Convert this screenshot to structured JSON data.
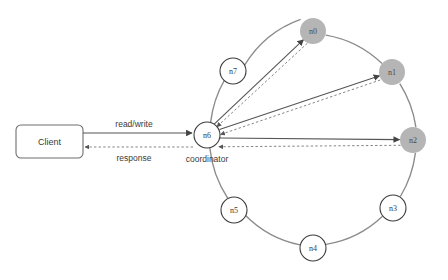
{
  "diagram": {
    "colors": {
      "ring_stroke": "#8c8c8c",
      "node_fill_plain": "#ffffff",
      "node_fill_shaded": "#b5b5b5",
      "node_stroke": "#3c3c3c",
      "edge_solid": "#555555",
      "edge_dashed": "#777777",
      "text": "#3a3a3a",
      "background": "#ffffff"
    },
    "client": {
      "label": "Client"
    },
    "coordinator_caption": "coordinator",
    "edges": {
      "request_label": "read/write",
      "response_label": "response"
    },
    "nodes": [
      {
        "id": "n0",
        "label": "n0",
        "shaded": true,
        "cx": 313,
        "cy": 31,
        "r": 13
      },
      {
        "id": "n1",
        "label": "n1",
        "shaded": true,
        "cx": 392,
        "cy": 72,
        "r": 13
      },
      {
        "id": "n2",
        "label": "n2",
        "shaded": true,
        "cx": 413,
        "cy": 140,
        "r": 13
      },
      {
        "id": "n3",
        "label": "n3",
        "shaded": false,
        "cx": 393,
        "cy": 208,
        "r": 13
      },
      {
        "id": "n4",
        "label": "n4",
        "shaded": false,
        "cx": 313,
        "cy": 248,
        "r": 13
      },
      {
        "id": "n5",
        "label": "n5",
        "shaded": false,
        "cx": 234,
        "cy": 210,
        "r": 13
      },
      {
        "id": "n6",
        "label": "n6",
        "shaded": false,
        "cx": 207,
        "cy": 135,
        "r": 13
      },
      {
        "id": "n7",
        "label": "n7",
        "shaded": false,
        "cx": 233,
        "cy": 71,
        "r": 13
      }
    ],
    "replica_targets": [
      "n0",
      "n1",
      "n2"
    ]
  }
}
